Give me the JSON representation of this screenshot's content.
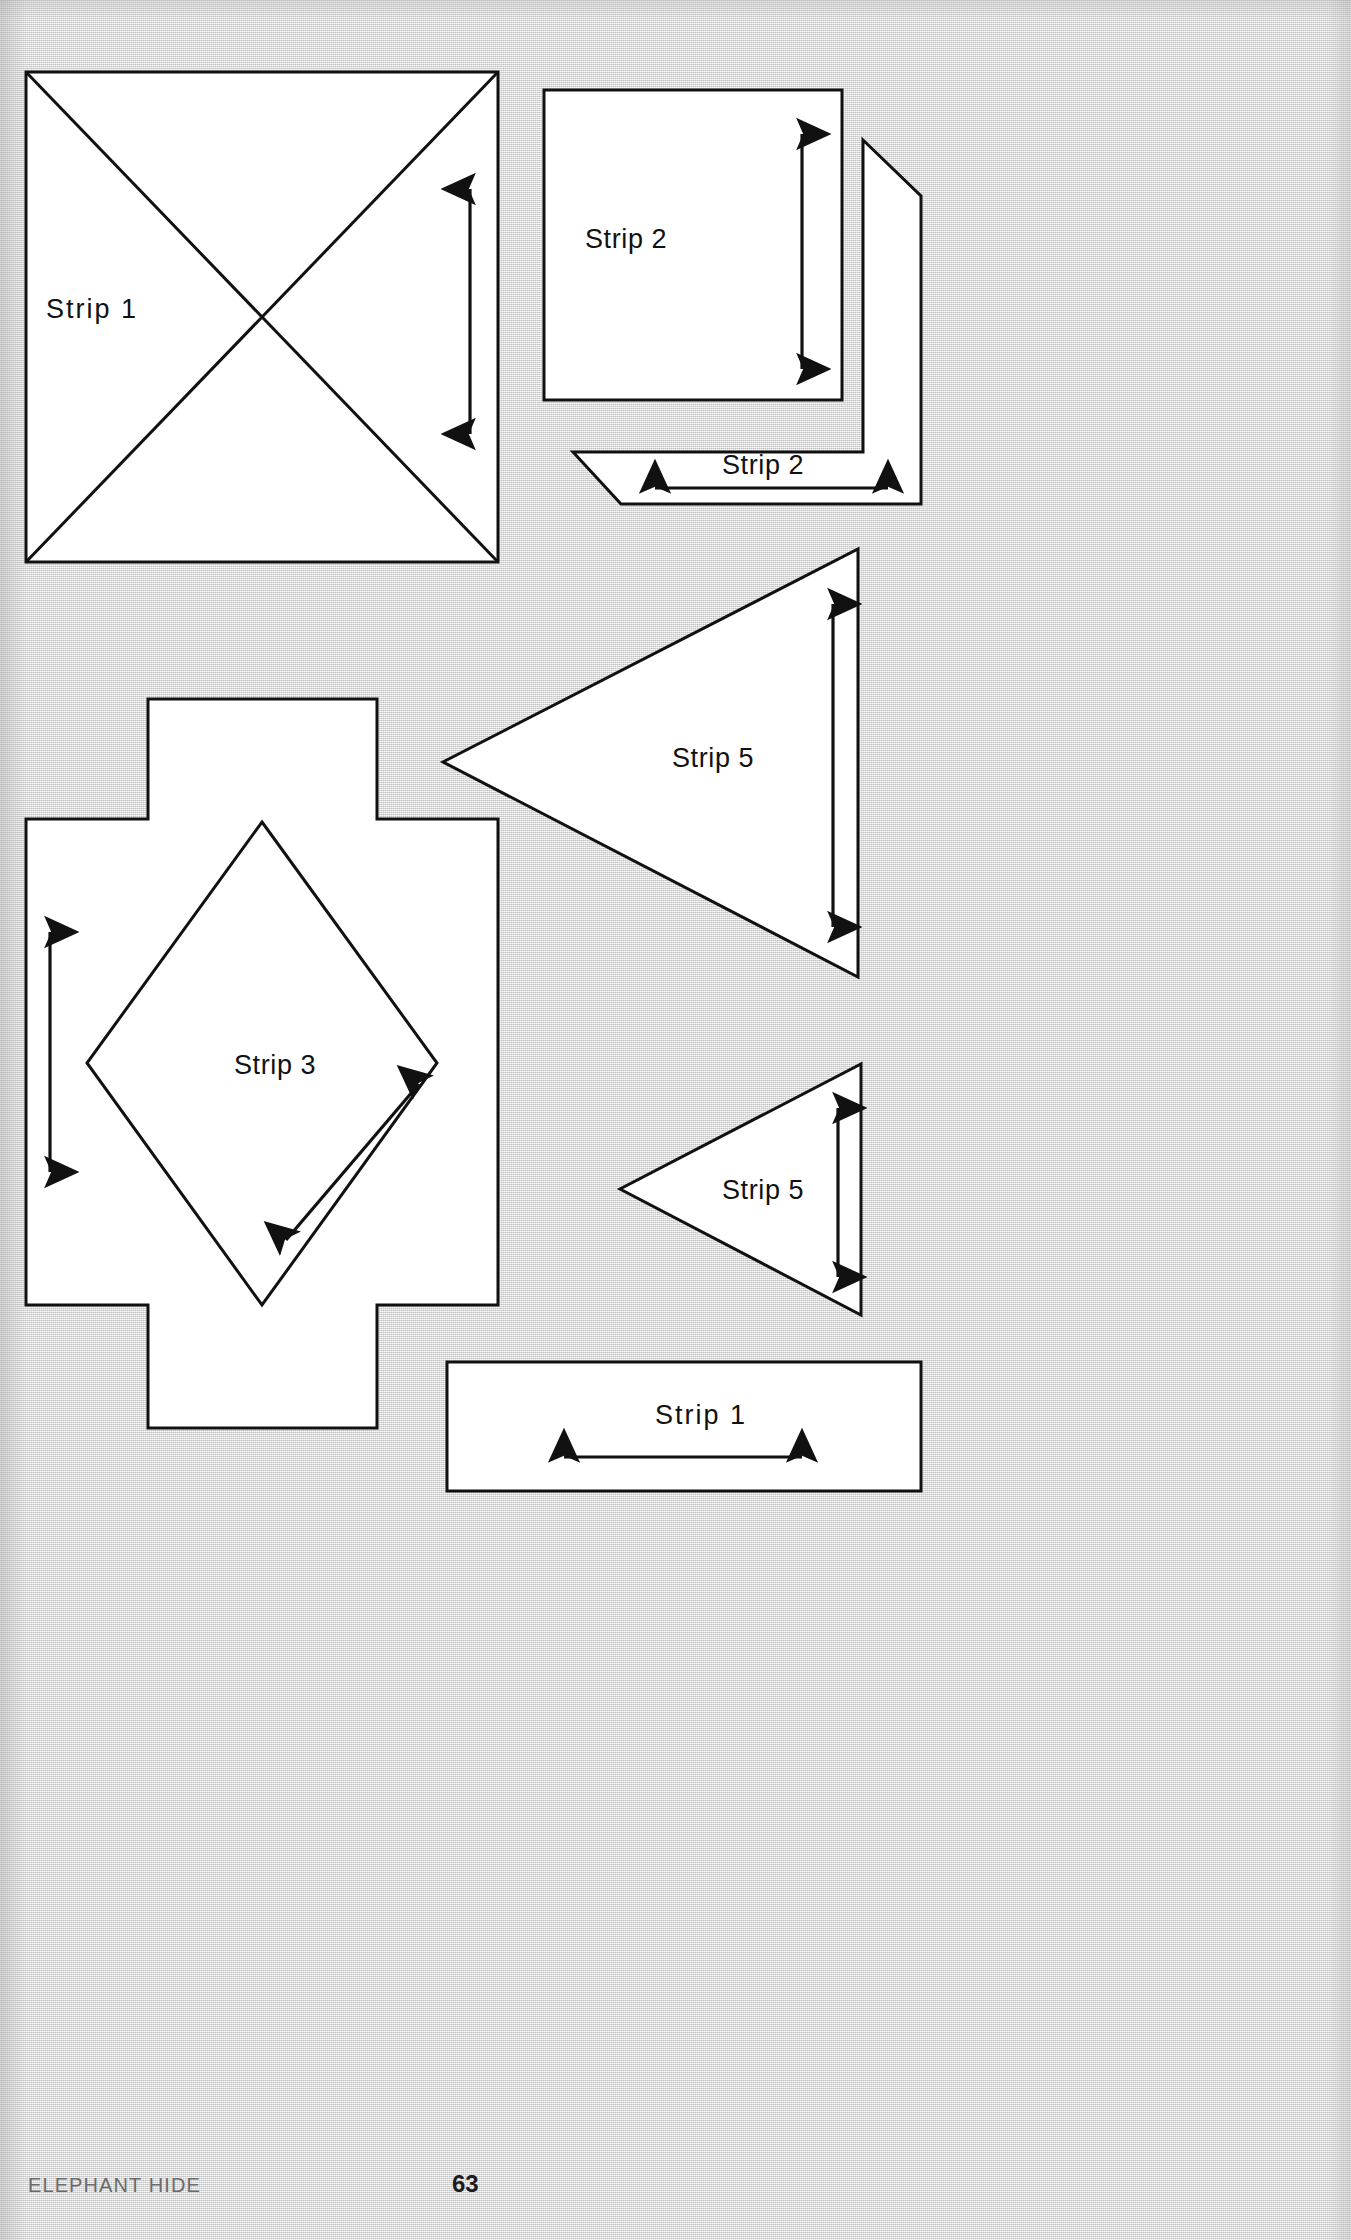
{
  "page": {
    "title": "Elephant Hide",
    "footer_left": "ELEPHANT HIDE",
    "page_number": "63",
    "background_color": "#dcdcdc",
    "paper_color": "#ffffff",
    "ink_color": "#111111",
    "footer_text_color": "#6a6a6a"
  },
  "labels": {
    "strip1_square": "Strip 1",
    "strip2_square": "Strip 2",
    "strip2_skewed": "Strip 2",
    "strip5_large": "Strip 5",
    "strip3_cross": "Strip 3",
    "strip5_small": "Strip 5",
    "strip1_rect": "Strip 1"
  },
  "shapes": [
    {
      "name": "strip1-square",
      "label": "Strip 1",
      "form": "square-with-diagonals",
      "x": 26,
      "y": 72,
      "width": 472,
      "height": 490,
      "fold_lines": "both diagonals",
      "grainline": {
        "direction": "vertical",
        "heads": "up",
        "x": 470,
        "y1": 189,
        "y2": 434
      }
    },
    {
      "name": "strip2-square",
      "label": "Strip 2",
      "form": "square",
      "x": 544,
      "y": 90,
      "width": 298,
      "height": 310,
      "grainline": {
        "direction": "vertical",
        "heads": "both",
        "x": 802,
        "y1": 131,
        "y2": 372
      }
    },
    {
      "name": "strip2-skewed",
      "label": "Strip 2",
      "form": "skewed-parallelogram",
      "points": "863,140 921,196 921,504 621,504 573,452 863,452",
      "grainline": {
        "direction": "horizontal",
        "heads": "both",
        "x1": 652,
        "x2": 891,
        "y": 488
      }
    },
    {
      "name": "strip5-large-triangle",
      "label": "Strip 5",
      "form": "triangle-pointing-left",
      "points": "858,549 858,977 443,762",
      "grainline": {
        "direction": "vertical",
        "heads": "both",
        "x": 833,
        "y1": 601,
        "y2": 930
      }
    },
    {
      "name": "strip3-cross",
      "label": "Strip 3",
      "form": "cross-with-inner-diamond",
      "outline": "148,699 377,699 377,819 498,819 498,1305 377,1305 377,1428 148,1428 148,1305 26,1305 26,819 148,819",
      "diamond": "262,822 437,1063 262,1305 87,1063",
      "grainline_left": {
        "direction": "vertical",
        "heads": "both",
        "x": 50,
        "y1": 929,
        "y2": 1175
      },
      "grainline_diagonal": {
        "direction": "diagonal",
        "heads": "both",
        "x1": 283,
        "y1": 1243,
        "x2": 422,
        "y2": 1081
      }
    },
    {
      "name": "strip5-small-triangle",
      "label": "Strip 5",
      "form": "triangle-pointing-left",
      "points": "861,1064 861,1315 620,1189",
      "grainline": {
        "direction": "vertical",
        "heads": "both",
        "x": 838,
        "y1": 1105,
        "y2": 1280
      }
    },
    {
      "name": "strip1-rect",
      "label": "Strip 1",
      "form": "rectangle",
      "x": 447,
      "y": 1362,
      "width": 474,
      "height": 129,
      "grainline": {
        "direction": "horizontal",
        "heads": "both",
        "x1": 561,
        "x2": 805,
        "y": 1457
      }
    }
  ]
}
